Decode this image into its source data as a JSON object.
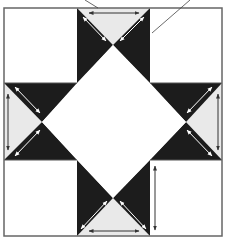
{
  "diagram": {
    "colors": {
      "dark": "#1c1c1c",
      "light": "#e9e9e9",
      "background": "#ffffff",
      "outline": "#555555",
      "arrow_on_light": "#333333",
      "arrow_on_dark": "#ffffff"
    },
    "grid": {
      "columns": 3,
      "rows": 3
    },
    "pieces": [
      {
        "id": "corner-top-left",
        "type": "square",
        "fill": "background"
      },
      {
        "id": "corner-top-right",
        "type": "square",
        "fill": "background"
      },
      {
        "id": "corner-bottom-left",
        "type": "square",
        "fill": "background"
      },
      {
        "id": "corner-bottom-right",
        "type": "square",
        "fill": "background",
        "grain_arrow": "vertical"
      },
      {
        "id": "center-square",
        "type": "square-on-point",
        "fill": "background"
      },
      {
        "id": "flying-geese-top",
        "type": "quarter-square-triangles",
        "outer": "light",
        "sides": "dark",
        "grain_arrows": [
          "horizontal",
          "diagonal",
          "diagonal"
        ]
      },
      {
        "id": "flying-geese-bottom",
        "type": "quarter-square-triangles",
        "outer": "light",
        "sides": "dark",
        "grain_arrows": [
          "horizontal",
          "diagonal",
          "diagonal"
        ]
      },
      {
        "id": "flying-geese-left",
        "type": "quarter-square-triangles",
        "outer": "light",
        "sides": "dark",
        "grain_arrows": [
          "vertical",
          "diagonal",
          "diagonal"
        ]
      },
      {
        "id": "flying-geese-right",
        "type": "quarter-square-triangles",
        "outer": "light",
        "sides": "dark",
        "grain_arrows": [
          "vertical",
          "diagonal",
          "diagonal"
        ]
      }
    ],
    "leader_lines": 2
  }
}
